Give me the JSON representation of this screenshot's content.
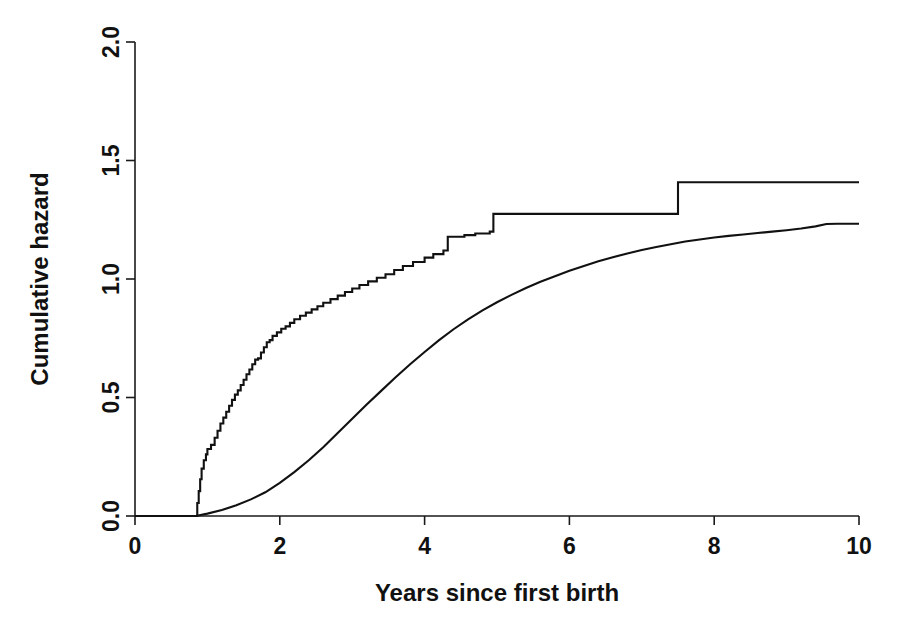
{
  "chart_data": {
    "type": "line",
    "title": "",
    "xlabel": "Years since first birth",
    "ylabel": "Cumulative hazard",
    "xlim": [
      0,
      10
    ],
    "ylim": [
      0,
      2.0
    ],
    "xticks": [
      0,
      2,
      4,
      6,
      8,
      10
    ],
    "xtick_labels": [
      "0",
      "2",
      "4",
      "6",
      "8",
      "10"
    ],
    "yticks": [
      0.0,
      0.5,
      1.0,
      1.5,
      2.0
    ],
    "ytick_labels": [
      "0.0",
      "0.5",
      "1.0",
      "1.5",
      "2.0"
    ],
    "grid": false,
    "legend": null,
    "series": [
      {
        "name": "Nelson-Aalen step estimate",
        "style": "step",
        "points": [
          [
            0.0,
            0.0
          ],
          [
            0.84,
            0.0
          ],
          [
            0.86,
            0.055
          ],
          [
            0.88,
            0.105
          ],
          [
            0.9,
            0.155
          ],
          [
            0.92,
            0.2
          ],
          [
            0.95,
            0.235
          ],
          [
            0.98,
            0.26
          ],
          [
            1.0,
            0.283
          ],
          [
            1.05,
            0.3
          ],
          [
            1.1,
            0.33
          ],
          [
            1.14,
            0.36
          ],
          [
            1.18,
            0.39
          ],
          [
            1.22,
            0.415
          ],
          [
            1.26,
            0.44
          ],
          [
            1.3,
            0.465
          ],
          [
            1.34,
            0.49
          ],
          [
            1.38,
            0.512
          ],
          [
            1.42,
            0.53
          ],
          [
            1.46,
            0.553
          ],
          [
            1.5,
            0.575
          ],
          [
            1.54,
            0.598
          ],
          [
            1.58,
            0.618
          ],
          [
            1.62,
            0.64
          ],
          [
            1.66,
            0.66
          ],
          [
            1.7,
            0.665
          ],
          [
            1.74,
            0.69
          ],
          [
            1.78,
            0.712
          ],
          [
            1.82,
            0.733
          ],
          [
            1.86,
            0.742
          ],
          [
            1.9,
            0.76
          ],
          [
            1.96,
            0.775
          ],
          [
            2.02,
            0.79
          ],
          [
            2.08,
            0.8
          ],
          [
            2.14,
            0.815
          ],
          [
            2.2,
            0.83
          ],
          [
            2.28,
            0.845
          ],
          [
            2.36,
            0.858
          ],
          [
            2.44,
            0.872
          ],
          [
            2.52,
            0.885
          ],
          [
            2.6,
            0.9
          ],
          [
            2.7,
            0.915
          ],
          [
            2.8,
            0.93
          ],
          [
            2.9,
            0.945
          ],
          [
            3.0,
            0.96
          ],
          [
            3.1,
            0.975
          ],
          [
            3.22,
            0.99
          ],
          [
            3.34,
            1.005
          ],
          [
            3.46,
            1.02
          ],
          [
            3.58,
            1.038
          ],
          [
            3.7,
            1.055
          ],
          [
            3.84,
            1.072
          ],
          [
            4.0,
            1.09
          ],
          [
            4.12,
            1.105
          ],
          [
            4.26,
            1.12
          ],
          [
            4.32,
            1.178
          ],
          [
            4.55,
            1.185
          ],
          [
            4.7,
            1.192
          ],
          [
            4.9,
            1.2
          ],
          [
            4.95,
            1.275
          ],
          [
            7.45,
            1.275
          ],
          [
            7.5,
            1.408
          ],
          [
            10.0,
            1.408
          ]
        ]
      },
      {
        "name": "Smooth parametric fit",
        "style": "smooth",
        "points": [
          [
            0.0,
            0.0
          ],
          [
            0.84,
            0.0
          ],
          [
            1.0,
            0.01
          ],
          [
            1.2,
            0.025
          ],
          [
            1.4,
            0.045
          ],
          [
            1.6,
            0.07
          ],
          [
            1.8,
            0.1
          ],
          [
            2.0,
            0.14
          ],
          [
            2.2,
            0.185
          ],
          [
            2.4,
            0.235
          ],
          [
            2.6,
            0.29
          ],
          [
            2.8,
            0.35
          ],
          [
            3.0,
            0.41
          ],
          [
            3.2,
            0.47
          ],
          [
            3.4,
            0.528
          ],
          [
            3.6,
            0.585
          ],
          [
            3.8,
            0.64
          ],
          [
            4.0,
            0.692
          ],
          [
            4.2,
            0.742
          ],
          [
            4.4,
            0.788
          ],
          [
            4.6,
            0.83
          ],
          [
            4.8,
            0.868
          ],
          [
            5.0,
            0.902
          ],
          [
            5.2,
            0.933
          ],
          [
            5.4,
            0.962
          ],
          [
            5.6,
            0.988
          ],
          [
            5.8,
            1.012
          ],
          [
            6.0,
            1.035
          ],
          [
            6.2,
            1.055
          ],
          [
            6.4,
            1.075
          ],
          [
            6.6,
            1.092
          ],
          [
            6.8,
            1.108
          ],
          [
            7.0,
            1.122
          ],
          [
            7.2,
            1.135
          ],
          [
            7.4,
            1.147
          ],
          [
            7.6,
            1.158
          ],
          [
            7.8,
            1.167
          ],
          [
            8.0,
            1.175
          ],
          [
            8.2,
            1.182
          ],
          [
            8.4,
            1.188
          ],
          [
            8.6,
            1.194
          ],
          [
            8.8,
            1.2
          ],
          [
            9.0,
            1.206
          ],
          [
            9.2,
            1.213
          ],
          [
            9.4,
            1.222
          ],
          [
            9.55,
            1.232
          ],
          [
            9.7,
            1.233
          ],
          [
            10.0,
            1.233
          ]
        ]
      }
    ],
    "colors": {
      "axis": "#111111",
      "line": "#111111",
      "background": "#ffffff"
    }
  }
}
